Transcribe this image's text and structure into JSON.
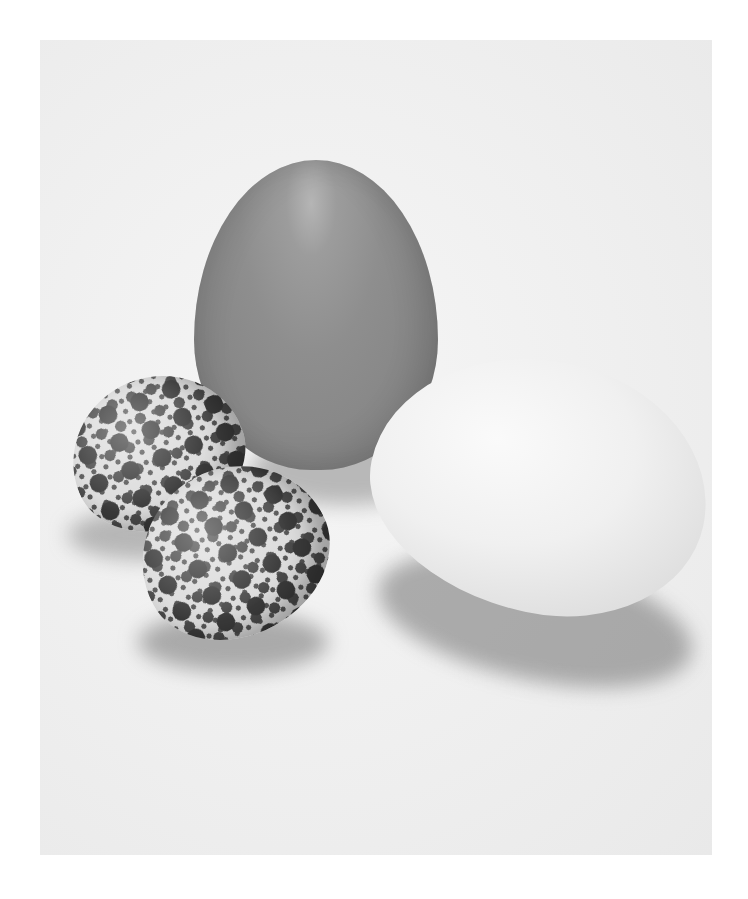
{
  "image": {
    "description": "Still-life black-and-white photograph of four eggs on a white surface",
    "subjects": [
      {
        "name": "large brown egg",
        "tone": "#8e8e8e"
      },
      {
        "name": "large white egg",
        "tone": "#f0f0f0"
      },
      {
        "name": "speckled quail egg (back)",
        "tone": "#dcdcdc"
      },
      {
        "name": "speckled quail egg (front)",
        "tone": "#dcdcdc"
      }
    ],
    "background_tone": "#efefef",
    "border_tone": "#ffffff"
  }
}
